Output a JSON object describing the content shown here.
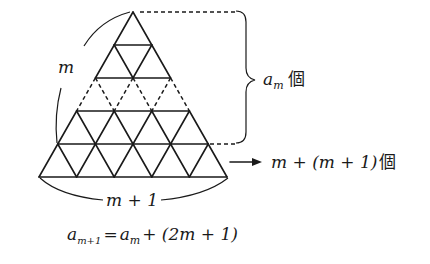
{
  "figure": {
    "type": "triangular-grid-induction",
    "big_triangle": {
      "apex": [
        133,
        12
      ],
      "base_left": [
        40,
        177
      ],
      "base_right": [
        228,
        177
      ],
      "rows": 5,
      "dashed_row_index": 2
    },
    "labels": {
      "side_label": "m",
      "base_label": "m + 1",
      "brace_label_var": "a",
      "brace_label_sub": "m",
      "brace_label_unit": "個",
      "arrow_label": "m + (m + 1)",
      "arrow_label_unit": "個"
    },
    "formula": {
      "lhs_var": "a",
      "lhs_sub": "m+1",
      "equals": "=",
      "rhs_var": "a",
      "rhs_sub": "m",
      "rhs_rest": "+ (2m + 1)"
    },
    "colors": {
      "ink": "#1a1a1a",
      "background": "#ffffff"
    }
  }
}
